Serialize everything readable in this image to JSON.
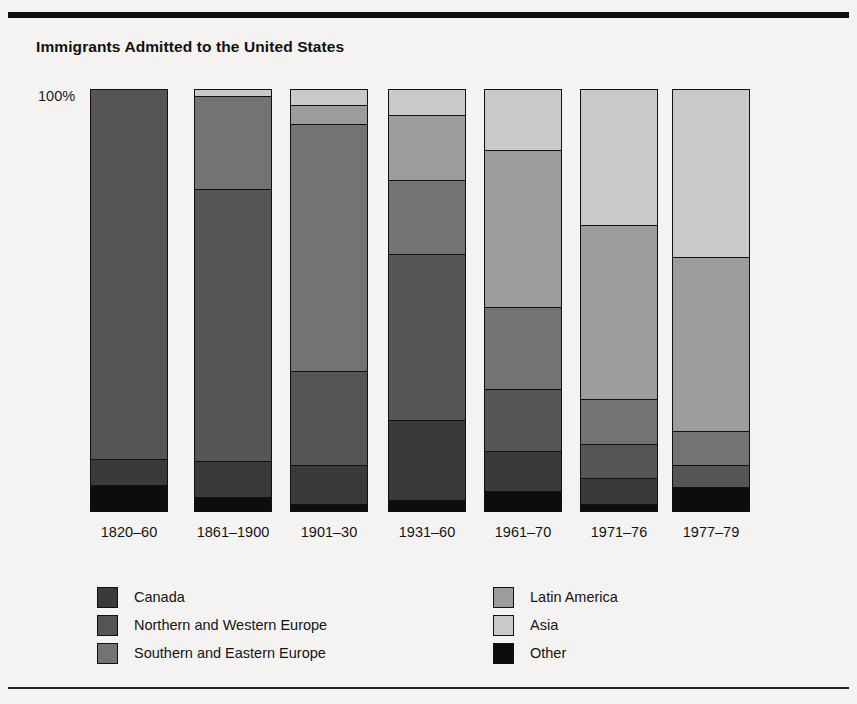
{
  "figure": {
    "title": "Immigrants Admitted to the United States",
    "y_axis_top_label": "100%"
  },
  "colors": {
    "canada": "#3a3a3a",
    "northern_western_europe": "#555555",
    "southern_eastern_europe": "#737373",
    "latin_america": "#9c9c9c",
    "asia": "#c9c9c9",
    "other": "#0d0d0d",
    "outline": "#111111",
    "background": "#f4f3f1"
  },
  "legend": {
    "left": [
      {
        "label": "Canada",
        "swatch": "canada"
      },
      {
        "label": "Northern and Western Europe",
        "swatch": "northern_western_europe"
      },
      {
        "label": "Southern and Eastern Europe",
        "swatch": "southern_eastern_europe"
      }
    ],
    "right": [
      {
        "label": "Latin America",
        "swatch": "latin_america"
      },
      {
        "label": "Asia",
        "swatch": "asia"
      },
      {
        "label": "Other",
        "swatch": "other"
      }
    ]
  },
  "chart_data": {
    "type": "bar",
    "subtype": "stacked-100-percent",
    "title": "Immigrants Admitted to the United States",
    "xlabel": "",
    "ylabel": "",
    "ylim": [
      0,
      100
    ],
    "ytick_labels": [
      "100%"
    ],
    "grid": false,
    "legend_position": "bottom",
    "categories": [
      "1820–60",
      "1861–1900",
      "1901–30",
      "1931–60",
      "1961–70",
      "1971–76",
      "1977–79"
    ],
    "series": [
      {
        "name": "Asia",
        "key": "asia",
        "values": [
          0.0,
          1.5,
          3.5,
          6.0,
          14.5,
          32.5,
          40.0
        ]
      },
      {
        "name": "Latin America",
        "key": "latin_america",
        "values": [
          0.0,
          0.0,
          4.5,
          15.5,
          37.5,
          41.5,
          41.5
        ]
      },
      {
        "name": "Southern and Eastern Europe",
        "key": "southern_eastern_europe",
        "values": [
          0.0,
          22.0,
          59.0,
          17.5,
          19.5,
          10.5,
          8.0
        ]
      },
      {
        "name": "Northern and Western Europe",
        "key": "northern_western_europe",
        "values": [
          88.0,
          65.0,
          22.5,
          39.5,
          14.5,
          8.0,
          5.0
        ]
      },
      {
        "name": "Canada",
        "key": "canada",
        "values": [
          6.0,
          8.5,
          9.0,
          19.0,
          9.5,
          6.0,
          0.0
        ]
      },
      {
        "name": "Other",
        "key": "other",
        "values": [
          6.0,
          3.0,
          1.5,
          2.5,
          4.5,
          1.5,
          5.5
        ]
      }
    ],
    "stack_order_top_to_bottom": [
      "asia",
      "latin_america",
      "southern_eastern_europe",
      "northern_western_europe",
      "canada",
      "other"
    ]
  },
  "layout": {
    "plot_top": 89,
    "plot_bottom": 512,
    "bar_width": 78,
    "bar_lefts": [
      90,
      194,
      290,
      388,
      484,
      580,
      672
    ],
    "label_y": 524,
    "legend_left_x": 137,
    "legend_right_x": 533,
    "legend_y": 584
  }
}
